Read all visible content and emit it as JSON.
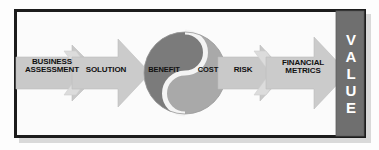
{
  "diagram": {
    "frame": {
      "border_color": "#1c1c1c",
      "background_color": "#fbfbfb"
    },
    "colors": {
      "arrow_fill": "#c9c9c9",
      "arrow_fill_light": "#d2d2d2",
      "chevron_fill": "#d7d7d7",
      "circle_dark": "#7b7b7b",
      "circle_mid": "#a9a9a9",
      "divider_white": "#f2f2f2",
      "value_bar": "#6f6f6f",
      "value_text": "#ffffff",
      "label_text": "#111111"
    },
    "steps": [
      {
        "id": "business-assessment",
        "shape": "block-arrow",
        "label_lines": [
          "BUSINESS",
          "ASSESSMENT"
        ],
        "label": "BUSINESS\nASSESSMENT"
      },
      {
        "id": "solution",
        "shape": "block-arrow",
        "label_lines": [
          "SOLUTION"
        ],
        "label": "SOLUTION"
      },
      {
        "id": "benefit",
        "shape": "yin-yang-half-dark",
        "label_lines": [
          "BENEFIT"
        ],
        "label": "BENEFIT"
      },
      {
        "id": "cost",
        "shape": "yin-yang-half-light",
        "label_lines": [
          "COST"
        ],
        "label": "COST"
      },
      {
        "id": "risk",
        "shape": "block-arrow",
        "label_lines": [
          "RISK"
        ],
        "label": "RISK"
      },
      {
        "id": "financial-metrics",
        "shape": "block-arrow",
        "label_lines": [
          "FINANCIAL",
          "METRICS"
        ],
        "label": "FINANCIAL\nMETRICS"
      }
    ],
    "outcome": {
      "id": "value",
      "shape": "vertical-bar",
      "label": "VALUE",
      "letters": [
        "V",
        "A",
        "L",
        "U",
        "E"
      ]
    },
    "connectors": [
      {
        "id": "chevron-1",
        "between": [
          "business-assessment",
          "solution"
        ]
      },
      {
        "id": "chevron-2",
        "between": [
          "risk",
          "financial-metrics"
        ]
      }
    ]
  }
}
